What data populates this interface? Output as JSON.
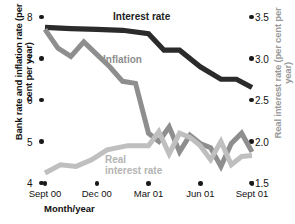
{
  "chart_data": {
    "type": "line",
    "title": "",
    "xlabel": "Month/year",
    "ylabel": "Bank rate and inflation rate (per cent per year)",
    "y2label": "Real interest rate (per cent per year)",
    "x_tick_labels": [
      "Sept 00",
      "Dec 00",
      "Mar 01",
      "Jun 01",
      "Sept 01"
    ],
    "y_tick_labels": [
      "8",
      "7",
      "6",
      "5",
      "4"
    ],
    "ylim": [
      4,
      8
    ],
    "y2_tick_labels": [
      "3.5",
      "3.0",
      "2.5",
      "2.0",
      "1.5"
    ],
    "y2lim": [
      1.5,
      3.5
    ],
    "grid": false,
    "legend": "inline-labels",
    "series": [
      {
        "name": "Interest rate",
        "axis": "left",
        "color": "#2b2b2b",
        "x": [
          0,
          0.5,
          1.0,
          1.5,
          2.0,
          2.3,
          2.6,
          3.0,
          3.4,
          3.7,
          4.0
        ],
        "values": [
          7.75,
          7.72,
          7.7,
          7.68,
          7.6,
          7.2,
          7.2,
          6.8,
          6.5,
          6.5,
          6.3
        ]
      },
      {
        "name": "Inflation",
        "axis": "left",
        "color": "#8e8e8e",
        "x": [
          0,
          0.25,
          0.5,
          0.75,
          1.0,
          1.25,
          1.5,
          1.75,
          2.0,
          2.2,
          2.4,
          2.6,
          2.8,
          3.0,
          3.2,
          3.4,
          3.6,
          3.8,
          4.0
        ],
        "values": [
          7.7,
          7.25,
          7.05,
          7.4,
          7.1,
          6.8,
          6.45,
          6.4,
          5.2,
          5.0,
          5.35,
          4.75,
          5.15,
          4.95,
          4.85,
          4.4,
          4.95,
          5.2,
          4.75
        ]
      },
      {
        "name": "Real interest rate",
        "axis": "right",
        "color": "#bfbfbf",
        "x": [
          0,
          0.3,
          0.6,
          0.9,
          1.2,
          1.6,
          2.0,
          2.2,
          2.4,
          2.6,
          2.8,
          3.0,
          3.2,
          3.4,
          3.6,
          3.8,
          4.0
        ],
        "values": [
          1.62,
          1.72,
          1.7,
          1.78,
          1.9,
          1.95,
          1.95,
          2.12,
          1.85,
          2.1,
          2.05,
          1.95,
          1.78,
          2.0,
          1.72,
          1.82,
          1.83
        ]
      }
    ]
  },
  "labels": {
    "interest_rate": "Interest rate",
    "inflation": "Inflation",
    "real_interest_rate": "Real\ninterest rate"
  }
}
